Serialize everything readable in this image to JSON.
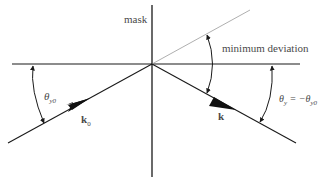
{
  "diagram": {
    "type": "ray-deflection-geometry",
    "labels": {
      "mask": "mask",
      "minimum_deviation": "minimum deviation",
      "theta_incident": "θ",
      "theta_incident_sub": "y0",
      "k0": "k",
      "k0_sub": "0",
      "k": "k",
      "theta_out": "θ",
      "theta_out_sub": "y",
      "theta_out_eq": " = −θ",
      "theta_out_eq_sub": "y0"
    },
    "colors": {
      "line": "#1a1a1a",
      "thin_line": "#9a9a9a",
      "text": "#4a4a4a",
      "background": "#ffffff"
    },
    "geometry": {
      "origin": [
        152,
        64
      ],
      "horizontal_axis": [
        [
          12,
          64
        ],
        [
          300,
          64
        ]
      ],
      "mask_line": [
        [
          152,
          5
        ],
        [
          152,
          177
        ]
      ],
      "incident_ray": [
        [
          8,
          143
        ],
        [
          152,
          64
        ]
      ],
      "deflected_ray": [
        [
          152,
          64
        ],
        [
          296,
          143
        ]
      ],
      "extension_line": [
        [
          152,
          64
        ],
        [
          250,
          10
        ]
      ]
    }
  }
}
